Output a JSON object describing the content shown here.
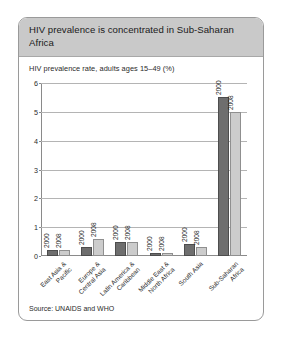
{
  "figure": {
    "title": "HIV prevalence is concentrated in Sub-Saharan Africa",
    "source": "Source: UNAIDS and WHO"
  },
  "colors": {
    "header_band": "#c9c9c9",
    "series_2000": "#6e6e6e",
    "series_2008": "#cccccc",
    "axis": "#8a8a8a",
    "gridline": "#b4b4b4"
  },
  "chart_data": {
    "type": "bar",
    "title": "HIV prevalence rate, adults ages 15–49 (%)",
    "xlabel": "",
    "ylabel": "",
    "ylim": [
      0,
      6
    ],
    "yticks": [
      0,
      1,
      2,
      3,
      4,
      5,
      6
    ],
    "grid": true,
    "legend": "none",
    "bar_value_labels": "year",
    "categories": [
      "East Asia &\nPacific",
      "Europe &\nCentral Asia",
      "Latin America &\nCaribbean",
      "Middle East &\nNorth Africa",
      "South Asia",
      "Sub-Saharan\nAfrica"
    ],
    "series": [
      {
        "name": "2000",
        "values": [
          0.2,
          0.3,
          0.5,
          0.1,
          0.4,
          5.5
        ]
      },
      {
        "name": "2008",
        "values": [
          0.2,
          0.6,
          0.5,
          0.1,
          0.3,
          5.0
        ]
      }
    ]
  }
}
